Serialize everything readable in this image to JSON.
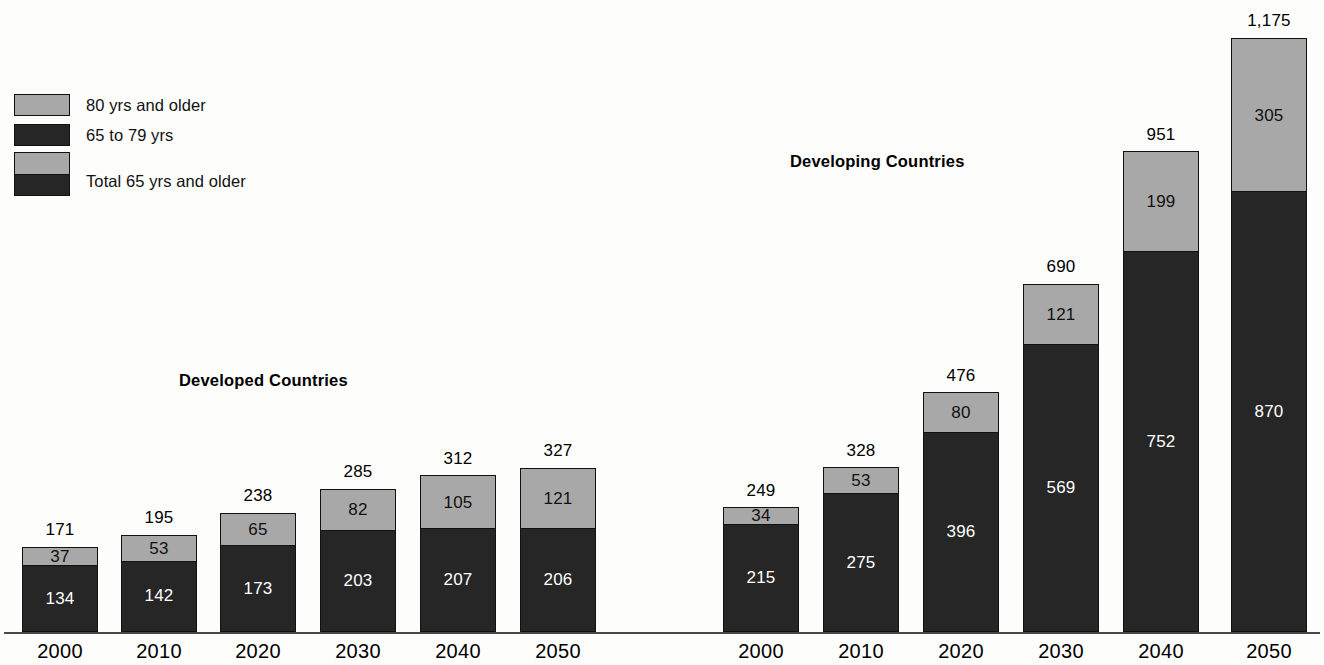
{
  "legend": {
    "items": [
      {
        "label": "80 yrs and older",
        "swatch": "gray",
        "color": "#a8a8a8"
      },
      {
        "label": "65 to 79 yrs",
        "swatch": "dark",
        "color": "#262626"
      },
      {
        "label": "Total 65 yrs and older",
        "swatch": "stacked",
        "color": "#a8a8a8"
      }
    ]
  },
  "groups": [
    {
      "id": "developed",
      "title": "Developed Countries"
    },
    {
      "id": "developing",
      "title": "Developing Countries"
    }
  ],
  "chart_data": {
    "type": "bar",
    "title": "",
    "subtitle": "",
    "xlabel": "",
    "ylabel": "",
    "stacked": true,
    "grid": false,
    "legend_position": "top-left",
    "axis_visible": {
      "x": true,
      "y": false
    },
    "ylim": [
      0,
      1175
    ],
    "value_unit": "millions",
    "categories": [
      "2000",
      "2010",
      "2020",
      "2030",
      "2040",
      "2050"
    ],
    "panels": [
      {
        "name": "Developed Countries",
        "categories": [
          "2000",
          "2010",
          "2020",
          "2030",
          "2040",
          "2050"
        ],
        "series": [
          {
            "name": "65 to 79 yrs",
            "color": "#262626",
            "values": [
              134,
              142,
              173,
              203,
              207,
              206
            ]
          },
          {
            "name": "80 yrs and older",
            "color": "#a8a8a8",
            "values": [
              37,
              53,
              65,
              82,
              105,
              121
            ]
          }
        ],
        "totals": [
          171,
          195,
          238,
          285,
          312,
          327
        ],
        "total_labels": [
          "171",
          "195",
          "238",
          "285",
          "312",
          "327"
        ]
      },
      {
        "name": "Developing Countries",
        "categories": [
          "2000",
          "2010",
          "2020",
          "2030",
          "2040",
          "2050"
        ],
        "series": [
          {
            "name": "65 to 79 yrs",
            "color": "#262626",
            "values": [
              215,
              275,
              396,
              569,
              752,
              870
            ]
          },
          {
            "name": "80 yrs and older",
            "color": "#a8a8a8",
            "values": [
              34,
              53,
              80,
              121,
              199,
              305
            ]
          }
        ],
        "totals": [
          249,
          328,
          476,
          690,
          951,
          1175
        ],
        "total_labels": [
          "249",
          "328",
          "476",
          "690",
          "951",
          "1,175"
        ]
      }
    ]
  },
  "bars": [
    {
      "group": "developed",
      "year": "2000",
      "x": 22,
      "w": 76,
      "mid": "134",
      "older": "37",
      "total": "171",
      "mid_v": 134,
      "older_v": 37
    },
    {
      "group": "developed",
      "year": "2010",
      "x": 121,
      "w": 76,
      "mid": "142",
      "older": "53",
      "total": "195",
      "mid_v": 142,
      "older_v": 53
    },
    {
      "group": "developed",
      "year": "2020",
      "x": 220,
      "w": 76,
      "mid": "173",
      "older": "65",
      "total": "238",
      "mid_v": 173,
      "older_v": 65
    },
    {
      "group": "developed",
      "year": "2030",
      "x": 320,
      "w": 76,
      "mid": "203",
      "older": "82",
      "total": "285",
      "mid_v": 203,
      "older_v": 82
    },
    {
      "group": "developed",
      "year": "2040",
      "x": 420,
      "w": 76,
      "mid": "207",
      "older": "105",
      "total": "312",
      "mid_v": 207,
      "older_v": 105
    },
    {
      "group": "developed",
      "year": "2050",
      "x": 520,
      "w": 76,
      "mid": "206",
      "older": "121",
      "total": "327",
      "mid_v": 206,
      "older_v": 121
    },
    {
      "group": "developing",
      "year": "2000",
      "x": 723,
      "w": 76,
      "mid": "215",
      "older": "34",
      "total": "249",
      "mid_v": 215,
      "older_v": 34
    },
    {
      "group": "developing",
      "year": "2010",
      "x": 823,
      "w": 76,
      "mid": "275",
      "older": "53",
      "total": "328",
      "mid_v": 275,
      "older_v": 53
    },
    {
      "group": "developing",
      "year": "2020",
      "x": 923,
      "w": 76,
      "mid": "396",
      "older": "80",
      "total": "476",
      "mid_v": 396,
      "older_v": 80
    },
    {
      "group": "developing",
      "year": "2030",
      "x": 1023,
      "w": 76,
      "mid": "569",
      "older": "121",
      "total": "690",
      "mid_v": 569,
      "older_v": 121
    },
    {
      "group": "developing",
      "year": "2040",
      "x": 1123,
      "w": 76,
      "mid": "752",
      "older": "199",
      "total": "951",
      "mid_v": 752,
      "older_v": 199
    },
    {
      "group": "developing",
      "year": "2050",
      "x": 1231,
      "w": 76,
      "mid": "870",
      "older": "305",
      "total": "1,175",
      "mid_v": 870,
      "older_v": 305
    }
  ],
  "axis": {
    "ticks": [
      {
        "label": "2000",
        "x": 22
      },
      {
        "label": "2010",
        "x": 121
      },
      {
        "label": "2020",
        "x": 220
      },
      {
        "label": "2030",
        "x": 320
      },
      {
        "label": "2040",
        "x": 420
      },
      {
        "label": "2050",
        "x": 520
      },
      {
        "label": "2000",
        "x": 723
      },
      {
        "label": "2010",
        "x": 823
      },
      {
        "label": "2020",
        "x": 923
      },
      {
        "label": "2030",
        "x": 1023
      },
      {
        "label": "2040",
        "x": 1123
      },
      {
        "label": "2050",
        "x": 1231
      }
    ]
  },
  "scale": {
    "px_per_unit": 0.5072,
    "baseline_y": 632
  }
}
